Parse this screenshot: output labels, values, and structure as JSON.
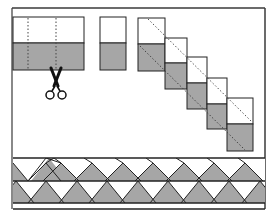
{
  "figure": {
    "title": "",
    "colors": {
      "background": "#ffffff",
      "frame": "#3a3a3a",
      "fabric_light": "#ffffff",
      "fabric_dark": "#a6a6a6",
      "line": "#222222",
      "dotted": "#555555"
    }
  },
  "steps": [
    {
      "id": "strip",
      "label": "",
      "segments_marked": 3
    },
    {
      "id": "segment",
      "label": ""
    },
    {
      "id": "staircase",
      "label": "",
      "segment_count": 5
    },
    {
      "id": "border-band",
      "label": ""
    }
  ],
  "icons": {
    "scissors": "scissors-icon"
  }
}
